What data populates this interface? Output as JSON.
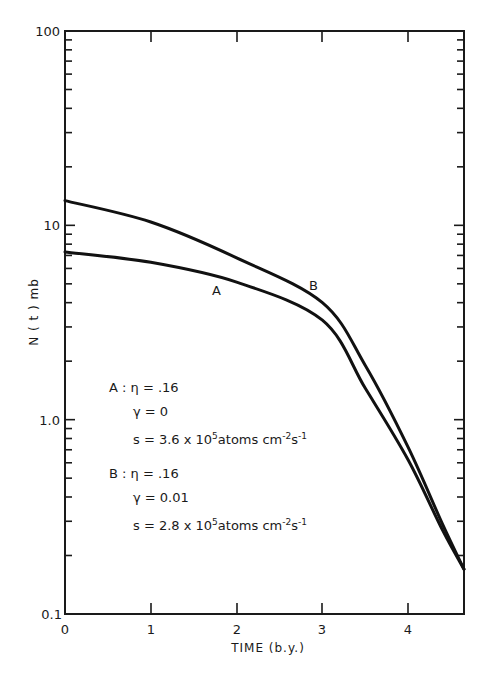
{
  "chart_data": {
    "type": "line",
    "title": "",
    "xlabel": "TIME (b.y.)",
    "ylabel": "N(t) mb",
    "xlim": [
      0,
      4.65
    ],
    "ylim": [
      0.1,
      100
    ],
    "yscale": "log",
    "grid": false,
    "x_ticks": [
      "0",
      "1",
      "2",
      "3",
      "4"
    ],
    "y_ticks": [
      "0.1",
      "1.0",
      "10",
      "100"
    ],
    "series": [
      {
        "name": "A",
        "x": [
          0,
          1,
          2,
          3,
          3.5,
          4,
          4.4,
          4.65
        ],
        "values": [
          7.3,
          6.45,
          5.1,
          3.25,
          1.45,
          0.62,
          0.27,
          0.17
        ]
      },
      {
        "name": "B",
        "x": [
          0,
          1,
          2,
          3,
          3.5,
          4,
          4.4,
          4.65
        ],
        "values": [
          13.4,
          10.4,
          6.8,
          4.0,
          1.9,
          0.72,
          0.29,
          0.17
        ]
      }
    ],
    "annotations": [
      {
        "label": "A",
        "x": 1.78,
        "y": 5.0
      },
      {
        "label": "B",
        "x": 2.9,
        "y": 4.4
      }
    ],
    "legend": {
      "A": {
        "eta": ".16",
        "gamma": "0",
        "s": "3.6 x 10^5 atoms cm^-2 s^-1"
      },
      "B": {
        "eta": ".16",
        "gamma": "0.01",
        "s": "2.8 x 10^5 atoms cm^-2 s^-1"
      }
    }
  },
  "labels": {
    "xlabel": "TIME (b.y.)",
    "ylabel": "N ( t )  mb",
    "x_ticks": [
      "0",
      "1",
      "2",
      "3",
      "4"
    ],
    "y_ticks": [
      "100",
      "10",
      "1.0",
      "0.1"
    ],
    "curve_a": "A",
    "curve_b": "B"
  },
  "legend": {
    "a_title": "A",
    "a_eta": "η = .16",
    "a_gamma": "γ = 0",
    "a_s_prefix": "s = 3.6 x 10",
    "a_s_exp": "5",
    "a_s_unit": "atoms cm",
    "a_s_exp2": "-2",
    "a_s_unit2": "s",
    "a_s_exp3": "-1",
    "b_title": "B",
    "b_eta": "η = .16",
    "b_gamma": "γ = 0.01",
    "b_s_prefix": "s = 2.8 x 10",
    "b_s_exp": "5",
    "b_s_unit": "atoms cm",
    "b_s_exp2": "-2",
    "b_s_unit2": "s",
    "b_s_exp3": "-1",
    "colon": " : "
  }
}
